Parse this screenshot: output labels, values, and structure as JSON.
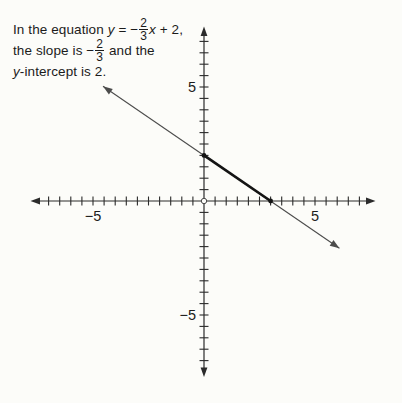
{
  "figure": {
    "background": "#fcfcf9",
    "text_color": "#1b1b1b",
    "annotation": {
      "line1": {
        "pre": "In the equation ",
        "var1": "y",
        "eq": " = −",
        "frac": {
          "num": "2",
          "den": "3"
        },
        "var2": "x",
        "post": " + 2,"
      },
      "line2": {
        "pre": "the slope is −",
        "frac": {
          "num": "2",
          "den": "3"
        },
        "post": " and the"
      },
      "line3": {
        "var": "y",
        "post": "-intercept is 2."
      }
    }
  },
  "chart_data": {
    "type": "line",
    "title": "",
    "equation": "y = -(2/3)x + 2",
    "slope": "-2/3",
    "y_intercept": 2,
    "x_intercept": 3,
    "series": [
      {
        "name": "y = -(2/3)x + 2",
        "x": [
          -4.55,
          6.1
        ],
        "y": [
          5.03,
          -2.07
        ],
        "arrows_both_ends": true
      }
    ],
    "highlight_segment": {
      "x": [
        0,
        3
      ],
      "y": [
        2,
        0
      ]
    },
    "marked_points": [
      [
        0,
        2
      ],
      [
        3,
        0
      ]
    ],
    "axes": {
      "xlim": [
        -7.6,
        7.6
      ],
      "ylim": [
        -7.9,
        7.9
      ],
      "tick_step": 0.5,
      "x_tick_range": [
        -7,
        7
      ],
      "y_tick_range": [
        -7,
        7
      ],
      "x_labels": [
        {
          "v": -5,
          "t": "−5"
        },
        {
          "v": 5,
          "t": "5"
        }
      ],
      "y_labels": [
        {
          "v": -5,
          "t": "−5"
        },
        {
          "v": 5,
          "t": "5"
        }
      ],
      "grid": false,
      "origin_marker": "open-circle"
    },
    "colors": {
      "axis": "#2b2b2b",
      "line": "#4c4c4c",
      "highlight": "#141414",
      "label": "#1c1c1c"
    }
  }
}
